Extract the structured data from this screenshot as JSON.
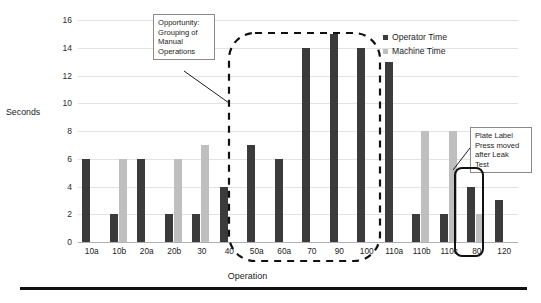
{
  "chart_data": {
    "type": "bar",
    "title": "",
    "xlabel": "Operation",
    "ylabel": "Seconds",
    "ylim": [
      0,
      16
    ],
    "ytick_step": 2,
    "yticks": [
      "16",
      "14",
      "12",
      "10",
      "8",
      "6",
      "4",
      "2",
      "0"
    ],
    "grid": true,
    "legend_position": "top-right",
    "categories": [
      "10a",
      "10b",
      "20a",
      "20b",
      "30",
      "40",
      "50a",
      "60a",
      "70",
      "90",
      "100",
      "110a",
      "110b",
      "110c",
      "80",
      "120"
    ],
    "series": [
      {
        "name": "Operator Time",
        "color": "#3b3b3b",
        "values": [
          6,
          2,
          6,
          2,
          2,
          4,
          7,
          6,
          14,
          15,
          14,
          13,
          2,
          2,
          4,
          3
        ]
      },
      {
        "name": "Machine Time",
        "color": "#bfbfbf",
        "values": [
          0,
          6,
          0,
          6,
          7,
          0,
          0,
          0,
          0,
          0,
          0,
          0,
          8,
          8,
          2,
          0
        ]
      }
    ],
    "annotations": [
      {
        "name": "opportunity-callout",
        "text": "Opportunity: Grouping of Manual Operations",
        "lines": [
          "Opportunity:",
          "Grouping of",
          "Manual",
          "Operations"
        ],
        "points_to": "dashed region around operations 50a-110a"
      },
      {
        "name": "plate-label-callout",
        "text": "Plate Label Press moved after Leak Test",
        "lines": [
          "Plate Label",
          "Press moved",
          "after Leak",
          "Test"
        ],
        "points_to": "highlighted operation 80"
      }
    ],
    "highlight_regions": [
      {
        "name": "manual-grouping-region",
        "style": "dashed-rounded",
        "from": "50a",
        "to": "110a"
      },
      {
        "name": "operation-80-region",
        "style": "solid-rounded",
        "from": "80",
        "to": "80"
      }
    ]
  },
  "chart": {
    "y_axis_title": "Seconds",
    "x_axis_title": "Operation",
    "legend": [
      {
        "label": "Operator Time",
        "color": "#3b3b3b"
      },
      {
        "label": "Machine Time",
        "color": "#bfbfbf"
      }
    ]
  }
}
